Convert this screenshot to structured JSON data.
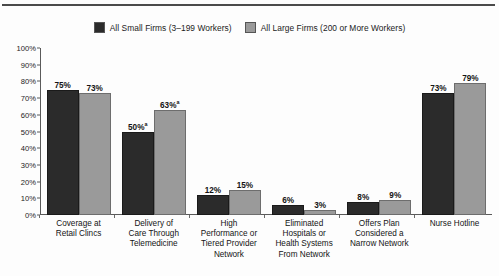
{
  "chart_data": {
    "type": "bar",
    "title": "",
    "subtitle": "",
    "xlabel": "",
    "ylabel": "",
    "ylim": [
      0,
      100
    ],
    "ytick_labels": [
      "100%",
      "90%",
      "80%",
      "70%",
      "60%",
      "50%",
      "40%",
      "30%",
      "20%",
      "10%",
      "0%"
    ],
    "ytick_values": [
      100,
      90,
      80,
      70,
      60,
      50,
      40,
      30,
      20,
      10,
      0
    ],
    "grid": false,
    "legend_position": "top-center",
    "categories": [
      "Coverage at Retail Clincs",
      "Delivery of Care Through Telemedicine",
      "High Performance or Tiered Provider Network",
      "Eliminated Hospitals or Health Systems From Network",
      "Offers Plan Considered a Narrow Network",
      "Nurse Hotline"
    ],
    "category_lines": [
      [
        "Coverage at",
        "Retail Clincs"
      ],
      [
        "Delivery of",
        "Care Through",
        "Telemedicine"
      ],
      [
        "High",
        "Performance or",
        "Tiered Provider",
        "Network"
      ],
      [
        "Eliminated",
        "Hospitals or",
        "Health Systems",
        "From Network"
      ],
      [
        "Offers Plan",
        "Considered a",
        "Narrow Network"
      ],
      [
        "Nurse Hotline"
      ]
    ],
    "series": [
      {
        "name": "All Small Firms (3–199 Workers)",
        "color": "#2b2b2b",
        "values": [
          75,
          50,
          12,
          6,
          8,
          73
        ],
        "labels": [
          "75%",
          "50%",
          "12%",
          "6%",
          "8%",
          "73%"
        ],
        "footnote_marks": [
          "",
          "a",
          "",
          "",
          "",
          ""
        ]
      },
      {
        "name": "All Large Firms (200 or More Workers)",
        "color": "#9a9a9a",
        "values": [
          73,
          63,
          15,
          3,
          9,
          79
        ],
        "labels": [
          "73%",
          "63%",
          "15%",
          "3%",
          "9%",
          "79%"
        ],
        "footnote_marks": [
          "",
          "a",
          "",
          "",
          "",
          ""
        ]
      }
    ]
  },
  "legend": {
    "items": [
      {
        "label": "All Small Firms (3–199 Workers)",
        "color": "#2b2b2b"
      },
      {
        "label": "All Large Firms (200 or More Workers)",
        "color": "#9a9a9a"
      }
    ]
  }
}
